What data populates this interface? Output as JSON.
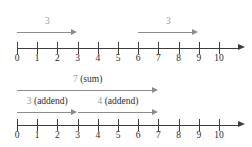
{
  "figure": {
    "axis": {
      "min": 0,
      "max": 10,
      "tick_labels": [
        "0",
        "1",
        "2",
        "3",
        "4",
        "5",
        "6",
        "7",
        "8",
        "9",
        "10"
      ]
    },
    "colors": {
      "axis": "#3d3d3d",
      "measure_rule": "#8c8c8c",
      "number_label": "#9a9a9a",
      "word_label": "#2b2b2b",
      "background": "#ffffff"
    },
    "diagrams": [
      {
        "id": "top",
        "arrows": [
          {
            "label_number": "3",
            "label_word": "",
            "from": 0,
            "to": 3
          },
          {
            "label_number": "3",
            "label_word": "",
            "from": 6,
            "to": 9
          }
        ]
      },
      {
        "id": "bottom",
        "arrows": [
          {
            "label_number": "7",
            "label_word": "(sum)",
            "from": 0,
            "to": 7
          },
          {
            "label_number": "3",
            "label_word": "(addend)",
            "from": 0,
            "to": 3
          },
          {
            "label_number": "4",
            "label_word": "(addend)",
            "from": 3,
            "to": 7
          }
        ]
      }
    ]
  }
}
